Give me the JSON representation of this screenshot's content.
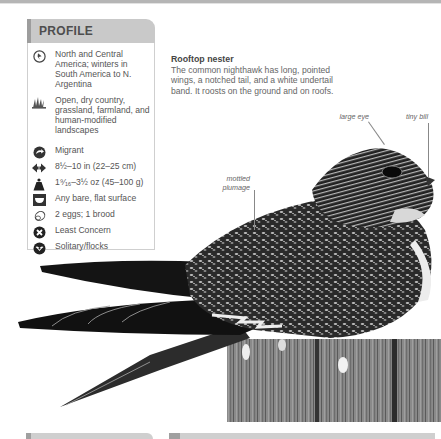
{
  "profile": {
    "title": "PROFILE",
    "items": [
      {
        "icon": "globe-range-icon",
        "text": "North and Central America; winters in South America to N. Argentina"
      },
      {
        "icon": "grass-habitat-icon",
        "text": "Open, dry country, grassland, farmland, and human-modified landscapes"
      },
      {
        "icon": "migration-icon",
        "text": "Migrant"
      },
      {
        "icon": "length-arrows-icon",
        "text": "8½–10 in (22–25 cm)"
      },
      {
        "icon": "weight-icon",
        "text": "1⁹⁄₁₆–3½ oz (45–100 g)"
      },
      {
        "icon": "nest-icon",
        "text": "Any bare, flat surface"
      },
      {
        "icon": "egg-icon",
        "text": "2 eggs; 1 brood"
      },
      {
        "icon": "conservation-status-icon",
        "text": "Least Concern"
      },
      {
        "icon": "social-behavior-icon",
        "text": "Solitary/flocks"
      }
    ]
  },
  "article": {
    "title": "Rooftop nester",
    "body": "The common nighthawk has long, pointed wings, a notched tail, and a white undertail band. It roosts on the ground and on roofs."
  },
  "callouts": {
    "large_eye": "large eye",
    "tiny_bill": "tiny bill",
    "mottled_plumage_1": "mottled",
    "mottled_plumage_2": "plumage"
  },
  "image": {
    "subject": "Common nighthawk perched on wooden post"
  }
}
